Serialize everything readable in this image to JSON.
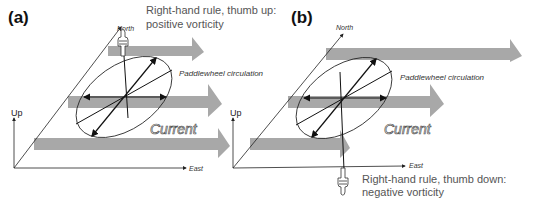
{
  "panels": [
    {
      "label": "(a)",
      "note_line1": "Right-hand rule, thumb up:",
      "note_line2": "positive vorticity",
      "axis_north": "North",
      "axis_east": "East",
      "axis_up": "Up",
      "circulation": "Paddlewheel circulation",
      "current": "Current"
    },
    {
      "label": "(b)",
      "note_line1": "Right-hand rule, thumb down:",
      "note_line2": "negative vorticity",
      "axis_north": "North",
      "axis_east": "East",
      "axis_up": "Up",
      "circulation": "Paddlewheel circulation",
      "current": "Current"
    }
  ],
  "colors": {
    "current_arrow": "#a8a8a8",
    "line": "#222222",
    "note_text": "#555555"
  }
}
